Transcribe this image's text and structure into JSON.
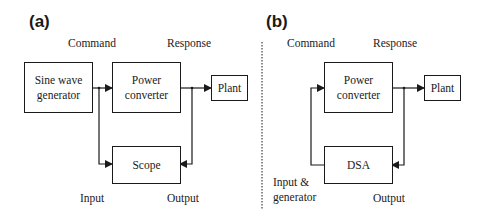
{
  "panel_a": {
    "label": "(a)",
    "command_label": "Command",
    "response_label": "Response",
    "input_label": "Input",
    "output_label": "Output",
    "blocks": {
      "generator": "Sine wave generator",
      "converter": "Power converter",
      "plant": "Plant",
      "scope": "Scope"
    }
  },
  "panel_b": {
    "label": "(b)",
    "command_label": "Command",
    "response_label": "Response",
    "input_label": "Input & generator",
    "output_label": "Output",
    "blocks": {
      "converter": "Power converter",
      "plant": "Plant",
      "analyzer": "DSA"
    }
  }
}
